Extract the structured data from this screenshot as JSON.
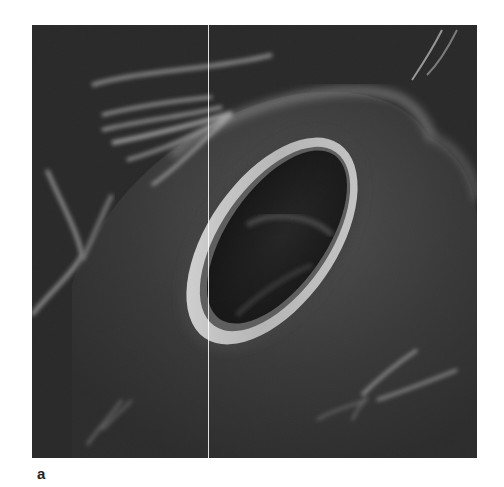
{
  "figure": {
    "panel_label": "a",
    "image": {
      "subject": "scanning electron micrograph of a stoma (pore with guard-cell rim)",
      "palette": {
        "background": "#1e1e1e",
        "surface": "#3a3a3a",
        "highlight": "#d8d8d8",
        "pore": "#0d0d0d"
      }
    }
  }
}
